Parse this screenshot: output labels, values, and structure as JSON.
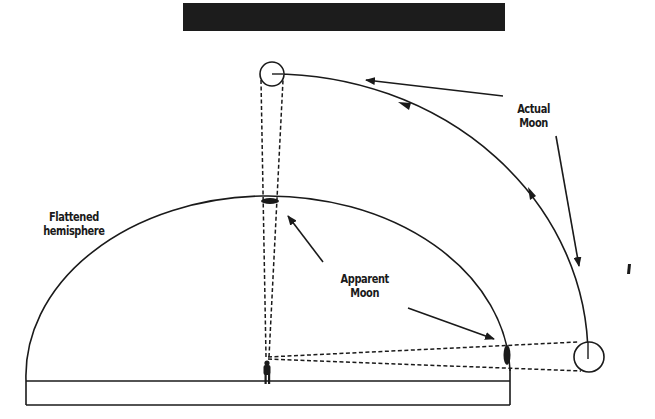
{
  "diagram": {
    "labels": {
      "flattened_hemisphere_line1": "Flattened",
      "flattened_hemisphere_line2": "hemisphere",
      "apparent_moon_line1": "Apparent",
      "apparent_moon_line2": "Moon",
      "actual_moon_line1": "Actual",
      "actual_moon_line2": "Moon"
    },
    "colors": {
      "ink": "#1a1a1a",
      "header_bar": "#1c1c1c",
      "background": "#ffffff"
    }
  }
}
